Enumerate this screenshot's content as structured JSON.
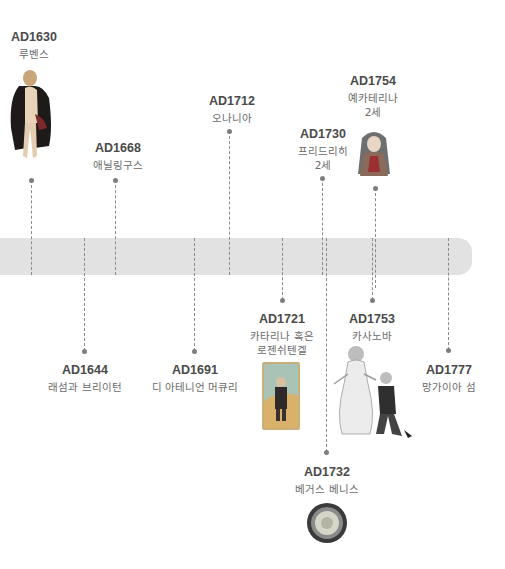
{
  "timeline": {
    "bar_color": "#e2e2e2",
    "events_above": [
      {
        "year": "AD1630",
        "name_lines": [
          "루벤스"
        ],
        "image": "rubens-figure-illustration"
      },
      {
        "year": "AD1668",
        "name_lines": [
          "애닐링구스"
        ]
      },
      {
        "year": "AD1712",
        "name_lines": [
          "오나니아"
        ]
      },
      {
        "year": "AD1730",
        "name_lines": [
          "프리드리히",
          "2세"
        ]
      },
      {
        "year": "AD1754",
        "name_lines": [
          "예카테리나",
          "2세"
        ],
        "image": "ekaterina-portrait-illustration"
      }
    ],
    "events_below": [
      {
        "year": "AD1644",
        "name_lines": [
          "래섬과 브리이턴"
        ]
      },
      {
        "year": "AD1691",
        "name_lines": [
          "디 아테니언 머큐리"
        ]
      },
      {
        "year": "AD1721",
        "name_lines": [
          "카타리나 혹은",
          "로젠쉬텐겔"
        ],
        "image": "katharina-card-illustration"
      },
      {
        "year": "AD1753",
        "name_lines": [
          "카사노바"
        ],
        "image": "casanova-couple-illustration"
      },
      {
        "year": "AD1777",
        "name_lines": [
          "망가이아 섬"
        ]
      },
      {
        "year": "AD1732",
        "name_lines": [
          "베거스 베니스"
        ],
        "image": "medal-illustration"
      }
    ]
  }
}
